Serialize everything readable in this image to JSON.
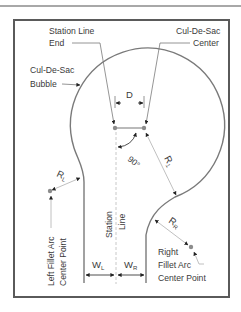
{
  "diagram": {
    "labels": {
      "station_line_end_1": "Station Line",
      "station_line_end_2": "End",
      "cul_de_sac_center_1": "Cul-De-Sac",
      "cul_de_sac_center_2": "Center",
      "cul_de_sac_bubble_1": "Cul-De-Sac",
      "cul_de_sac_bubble_2": "Bubble",
      "offset_distance": "D",
      "angle": "90°",
      "radius_bubble": "R",
      "radius_bubble_sub": "1",
      "radius_left": "R",
      "radius_left_sub": "L",
      "radius_right": "R",
      "radius_right_sub": "R",
      "left_fillet_1": "Left Fillet Arc",
      "left_fillet_2": "Center Point",
      "station_line_1": "Station",
      "station_line_2": "Line",
      "width_left": "W",
      "width_left_sub": "L",
      "width_right": "W",
      "width_right_sub": "R",
      "right_fillet_1": "Right",
      "right_fillet_2": "Fillet Arc",
      "right_fillet_3": "Center Point"
    },
    "colors": {
      "line": "#7a7a7a",
      "frame": "#5a5a5a",
      "text": "#3a3a3a",
      "point": "#8c8c8c",
      "dashed": "#c8c8c8"
    }
  }
}
